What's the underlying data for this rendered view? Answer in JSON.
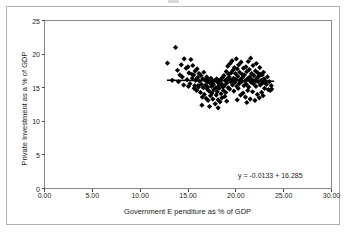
{
  "chart_data": {
    "type": "scatter",
    "title": "",
    "xlabel": "Government E penditure as % of GDP",
    "ylabel": "Private Investment as a % of GDP",
    "xlim": [
      0,
      30
    ],
    "ylim": [
      0,
      25
    ],
    "xticks": [
      "0.00",
      "5.00",
      "10.00",
      "15.00",
      "20.00",
      "25.00",
      "30.00"
    ],
    "xtick_values": [
      0,
      5,
      10,
      15,
      20,
      25,
      30
    ],
    "yticks": [
      "0",
      "5",
      "10",
      "15",
      "20",
      "25"
    ],
    "ytick_values": [
      0,
      5,
      10,
      15,
      20,
      25
    ],
    "grid": false,
    "legend": "none",
    "annotations": [
      {
        "name": "regression-equation",
        "text": "y = -0.0133  + 16.285",
        "x": 0.68,
        "y": 0.12
      }
    ],
    "trendline": {
      "slope": -0.0133,
      "intercept": 16.285,
      "x_start": 12.8,
      "x_end": 24.0
    },
    "marker": {
      "shape": "diamond",
      "color": "#000000",
      "size": 2.6
    },
    "points": [
      [
        12.85,
        18.65
      ],
      [
        13.35,
        16.1
      ],
      [
        13.7,
        21.0
      ],
      [
        13.9,
        17.6
      ],
      [
        14.0,
        15.9
      ],
      [
        14.3,
        18.4
      ],
      [
        14.4,
        16.6
      ],
      [
        14.6,
        19.3
      ],
      [
        14.8,
        17.9
      ],
      [
        14.9,
        16.2
      ],
      [
        15.0,
        18.1
      ],
      [
        15.1,
        17.2
      ],
      [
        15.2,
        15.6
      ],
      [
        15.3,
        19.2
      ],
      [
        15.4,
        17.0
      ],
      [
        15.45,
        16.4
      ],
      [
        15.5,
        18.3
      ],
      [
        15.6,
        16.9
      ],
      [
        15.7,
        15.3
      ],
      [
        15.75,
        17.5
      ],
      [
        15.8,
        16.1
      ],
      [
        15.9,
        14.6
      ],
      [
        15.95,
        17.8
      ],
      [
        16.0,
        16.5
      ],
      [
        16.1,
        15.1
      ],
      [
        16.15,
        17.1
      ],
      [
        16.2,
        16.0
      ],
      [
        16.3,
        14.3
      ],
      [
        16.35,
        16.8
      ],
      [
        16.4,
        15.5
      ],
      [
        16.5,
        13.6
      ],
      [
        16.55,
        16.3
      ],
      [
        16.6,
        15.0
      ],
      [
        16.65,
        17.3
      ],
      [
        16.7,
        14.0
      ],
      [
        16.8,
        16.1
      ],
      [
        16.85,
        15.4
      ],
      [
        16.9,
        13.4
      ],
      [
        16.95,
        16.6
      ],
      [
        17.0,
        14.8
      ],
      [
        17.05,
        15.9
      ],
      [
        17.1,
        13.1
      ],
      [
        17.15,
        16.2
      ],
      [
        17.2,
        14.5
      ],
      [
        17.3,
        15.7
      ],
      [
        17.35,
        13.8
      ],
      [
        17.4,
        16.4
      ],
      [
        17.45,
        15.2
      ],
      [
        17.5,
        14.2
      ],
      [
        17.55,
        16.0
      ],
      [
        17.6,
        13.3
      ],
      [
        17.65,
        15.5
      ],
      [
        17.7,
        14.7
      ],
      [
        17.8,
        16.1
      ],
      [
        17.85,
        12.6
      ],
      [
        17.9,
        15.0
      ],
      [
        17.95,
        13.9
      ],
      [
        18.0,
        16.3
      ],
      [
        18.05,
        14.4
      ],
      [
        18.1,
        15.8
      ],
      [
        18.15,
        13.2
      ],
      [
        18.2,
        16.0
      ],
      [
        18.25,
        14.9
      ],
      [
        18.3,
        15.4
      ],
      [
        18.35,
        12.9
      ],
      [
        18.4,
        16.2
      ],
      [
        18.45,
        14.1
      ],
      [
        18.5,
        15.6
      ],
      [
        18.55,
        13.5
      ],
      [
        18.6,
        16.5
      ],
      [
        18.65,
        15.1
      ],
      [
        18.7,
        14.6
      ],
      [
        18.75,
        16.8
      ],
      [
        18.8,
        15.3
      ],
      [
        18.85,
        13.7
      ],
      [
        18.9,
        16.1
      ],
      [
        18.95,
        14.3
      ],
      [
        19.0,
        17.4
      ],
      [
        19.05,
        15.7
      ],
      [
        19.1,
        16.3
      ],
      [
        19.15,
        18.2
      ],
      [
        19.2,
        15.0
      ],
      [
        19.25,
        17.0
      ],
      [
        19.3,
        16.6
      ],
      [
        19.35,
        14.8
      ],
      [
        19.4,
        18.6
      ],
      [
        19.45,
        15.9
      ],
      [
        19.5,
        17.2
      ],
      [
        19.55,
        16.0
      ],
      [
        19.6,
        19.0
      ],
      [
        19.65,
        15.4
      ],
      [
        19.7,
        17.6
      ],
      [
        19.75,
        16.4
      ],
      [
        19.8,
        14.5
      ],
      [
        19.85,
        18.0
      ],
      [
        19.9,
        15.8
      ],
      [
        19.95,
        17.1
      ],
      [
        20.0,
        16.2
      ],
      [
        20.05,
        19.3
      ],
      [
        20.1,
        15.2
      ],
      [
        20.15,
        17.8
      ],
      [
        20.2,
        16.7
      ],
      [
        20.25,
        14.9
      ],
      [
        20.3,
        18.4
      ],
      [
        20.35,
        15.6
      ],
      [
        20.4,
        17.3
      ],
      [
        20.45,
        16.1
      ],
      [
        20.5,
        13.9
      ],
      [
        20.55,
        18.8
      ],
      [
        20.6,
        15.9
      ],
      [
        20.65,
        17.0
      ],
      [
        20.7,
        16.5
      ],
      [
        20.75,
        14.2
      ],
      [
        20.8,
        17.9
      ],
      [
        20.85,
        15.3
      ],
      [
        20.9,
        16.9
      ],
      [
        20.95,
        16.0
      ],
      [
        21.0,
        13.6
      ],
      [
        21.05,
        18.1
      ],
      [
        21.1,
        15.5
      ],
      [
        21.15,
        17.4
      ],
      [
        21.2,
        16.3
      ],
      [
        21.25,
        14.6
      ],
      [
        21.3,
        18.9
      ],
      [
        21.35,
        15.1
      ],
      [
        21.4,
        17.7
      ],
      [
        21.45,
        16.6
      ],
      [
        21.5,
        13.3
      ],
      [
        21.55,
        19.4
      ],
      [
        21.6,
        15.8
      ],
      [
        21.65,
        17.1
      ],
      [
        21.7,
        16.2
      ],
      [
        21.75,
        14.4
      ],
      [
        21.8,
        18.3
      ],
      [
        21.85,
        15.6
      ],
      [
        21.9,
        16.8
      ],
      [
        21.95,
        16.0
      ],
      [
        22.0,
        13.1
      ],
      [
        22.05,
        17.5
      ],
      [
        22.1,
        15.2
      ],
      [
        22.15,
        18.6
      ],
      [
        22.2,
        16.4
      ],
      [
        22.25,
        14.0
      ],
      [
        22.3,
        17.2
      ],
      [
        22.35,
        15.9
      ],
      [
        22.4,
        16.7
      ],
      [
        22.45,
        13.5
      ],
      [
        22.5,
        18.0
      ],
      [
        22.55,
        15.4
      ],
      [
        22.6,
        17.0
      ],
      [
        22.65,
        16.1
      ],
      [
        22.7,
        14.3
      ],
      [
        22.75,
        16.9
      ],
      [
        22.8,
        15.7
      ],
      [
        22.85,
        13.8
      ],
      [
        22.9,
        17.3
      ],
      [
        22.95,
        16.3
      ],
      [
        23.0,
        14.9
      ],
      [
        23.1,
        16.0
      ],
      [
        23.2,
        15.5
      ],
      [
        23.3,
        16.6
      ],
      [
        23.4,
        14.7
      ],
      [
        23.5,
        15.9
      ],
      [
        23.6,
        14.6
      ],
      [
        23.7,
        15.3
      ],
      [
        23.75,
        14.8
      ],
      [
        16.45,
        12.4
      ],
      [
        17.25,
        12.2
      ],
      [
        18.15,
        12.0
      ],
      [
        19.05,
        13.0
      ],
      [
        20.15,
        13.2
      ],
      [
        21.15,
        12.8
      ],
      [
        15.05,
        15.2
      ],
      [
        15.65,
        14.9
      ],
      [
        14.55,
        15.4
      ],
      [
        14.15,
        16.9
      ],
      [
        19.45,
        16.1
      ],
      [
        20.45,
        16.2
      ],
      [
        21.45,
        16.1
      ],
      [
        22.15,
        16.0
      ],
      [
        18.05,
        15.0
      ],
      [
        17.05,
        15.1
      ],
      [
        16.05,
        15.3
      ],
      [
        23.05,
        15.8
      ]
    ]
  }
}
